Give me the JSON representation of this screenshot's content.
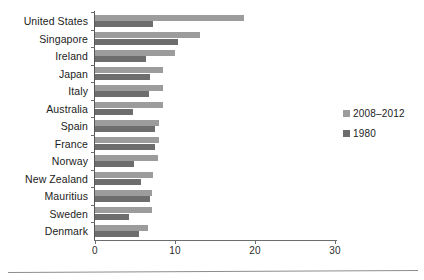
{
  "chart_data": {
    "type": "bar",
    "orientation": "horizontal",
    "title": "",
    "subtitle": "",
    "xlabel": "",
    "ylabel": "",
    "xlim": [
      0,
      30
    ],
    "xticks": [
      0,
      10,
      20,
      30
    ],
    "xtick_labels": [
      "0",
      "10",
      "20",
      "30"
    ],
    "grid": false,
    "legend_position": "right",
    "categories": [
      "United States",
      "Singapore",
      "Ireland",
      "Japan",
      "Italy",
      "Australia",
      "Spain",
      "France",
      "Norway",
      "New Zealand",
      "Mauritius",
      "Sweden",
      "Denmark"
    ],
    "series": [
      {
        "name": "2008-2012",
        "color": "#9c9c9c",
        "values": [
          18.6,
          13.1,
          10.0,
          8.5,
          8.5,
          8.5,
          8.0,
          8.0,
          7.9,
          7.2,
          7.1,
          7.1,
          6.6
        ]
      },
      {
        "name": "1980",
        "color": "#6d6d6d",
        "values": [
          7.3,
          10.4,
          6.4,
          6.9,
          6.8,
          4.7,
          7.5,
          7.5,
          4.9,
          5.8,
          6.9,
          4.3,
          5.5
        ]
      }
    ]
  },
  "legend": {
    "items": [
      {
        "label": "2008–2012",
        "color": "#9c9c9c"
      },
      {
        "label": "1980",
        "color": "#6d6d6d"
      }
    ]
  }
}
